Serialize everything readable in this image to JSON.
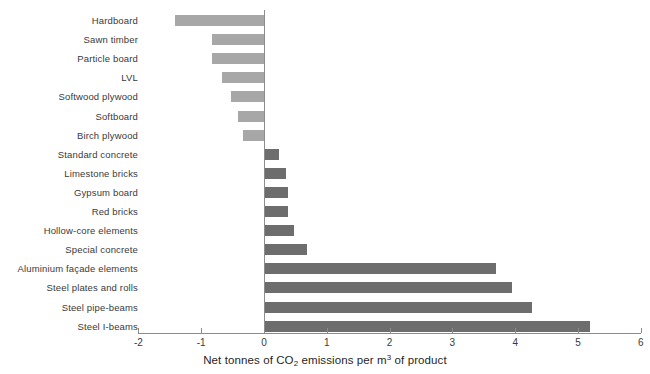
{
  "chart_data": {
    "type": "bar",
    "orientation": "horizontal",
    "title": "",
    "xlabel": "Net tonnes of CO2 emissions per m3 of product",
    "xlabel_parts": {
      "before": "Net tonnes of CO",
      "sub": "2",
      "middle": " emissions per m",
      "sup": "3",
      "after": " of product"
    },
    "ylabel": "",
    "xlim": [
      -2,
      6
    ],
    "xticks": [
      -2,
      -1,
      0,
      1,
      2,
      3,
      4,
      5,
      6
    ],
    "xtick_labels": [
      "-2",
      "-1",
      "0",
      "1",
      "2",
      "3",
      "4",
      "5",
      "6"
    ],
    "grid": false,
    "legend": "none",
    "categories": [
      "Hardboard",
      "Sawn timber",
      "Particle board",
      "LVL",
      "Softwood plywood",
      "Softboard",
      "Birch plywood",
      "Standard concrete",
      "Limestone bricks",
      "Gypsum board",
      "Red bricks",
      "Hollow-core elements",
      "Special concrete",
      "Aluminium façade elements",
      "Steel plates and rolls",
      "Steel pipe-beams",
      "Steel I-beams"
    ],
    "values": [
      -1.42,
      -0.83,
      -0.83,
      -0.67,
      -0.53,
      -0.41,
      -0.33,
      0.24,
      0.35,
      0.38,
      0.38,
      0.47,
      0.68,
      3.69,
      3.95,
      4.27,
      5.19
    ],
    "colors": {
      "negative": "#a7a7a7",
      "positive": "#6d6d6d",
      "axis": "#8c8c8c",
      "text": "#3a3a3a",
      "background": "#ffffff"
    }
  }
}
